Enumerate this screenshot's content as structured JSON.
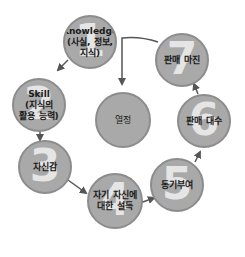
{
  "diagram": {
    "nodes": [
      {
        "id": "1",
        "number": "1",
        "label": "Knowledge\n(사실, 정보,\n지식)"
      },
      {
        "id": "2",
        "number": "2",
        "label": "Skill\n(지식의\n활용 능력)"
      },
      {
        "id": "3",
        "number": "3",
        "label": "자신감"
      },
      {
        "id": "4",
        "number": "4",
        "label": "자기 자신에\n대한 설득"
      },
      {
        "id": "5",
        "number": "5",
        "label": "동기부여"
      },
      {
        "id": "6",
        "number": "6",
        "label": "판매 대수"
      },
      {
        "id": "7",
        "number": "7",
        "label": "판매 마진"
      }
    ],
    "center": {
      "label": "열정"
    },
    "edges": [
      {
        "from": "1",
        "to": "2"
      },
      {
        "from": "2",
        "to": "3"
      },
      {
        "from": "3",
        "to": "4"
      },
      {
        "from": "4",
        "to": "5"
      },
      {
        "from": "5",
        "to": "6"
      },
      {
        "from": "6",
        "to": "7"
      },
      {
        "from": "7",
        "to": "center"
      }
    ],
    "colors": {
      "circle_fill": "#a9a9a9",
      "circle_border": "#8c8c8c",
      "number": "#ececec",
      "arrow": "#555555",
      "text": "#1a1a1a"
    }
  }
}
